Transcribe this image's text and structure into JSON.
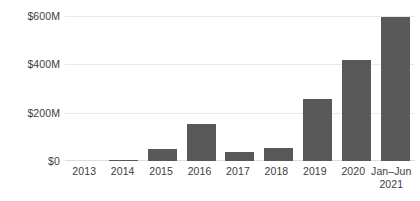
{
  "chart_data": {
    "type": "bar",
    "title": "",
    "subtitle": "",
    "xlabel": "",
    "ylabel": "",
    "ylim": [
      0,
      600
    ],
    "yunit": "$M",
    "grid": true,
    "legend": false,
    "bar_color": "#595959",
    "gridline_color": "#e9e9e9",
    "text_color": "#3d3d3d",
    "background_color": "#ffffff",
    "categories": [
      "2013",
      "2014",
      "2015",
      "2016",
      "2017",
      "2018",
      "2019",
      "2020",
      "Jan–Jun 2021"
    ],
    "category_labels": [
      {
        "line1": "2013",
        "line2": ""
      },
      {
        "line1": "2014",
        "line2": ""
      },
      {
        "line1": "2015",
        "line2": ""
      },
      {
        "line1": "2016",
        "line2": ""
      },
      {
        "line1": "2017",
        "line2": ""
      },
      {
        "line1": "2018",
        "line2": ""
      },
      {
        "line1": "2019",
        "line2": ""
      },
      {
        "line1": "2020",
        "line2": ""
      },
      {
        "line1": "Jan–Jun",
        "line2": "2021"
      }
    ],
    "values": [
      0,
      3,
      50,
      152,
      37,
      55,
      255,
      420,
      595
    ],
    "yticks": [
      0,
      200,
      400,
      600
    ],
    "ytick_labels": [
      "$0",
      "$200M",
      "$400M",
      "$600M"
    ]
  }
}
